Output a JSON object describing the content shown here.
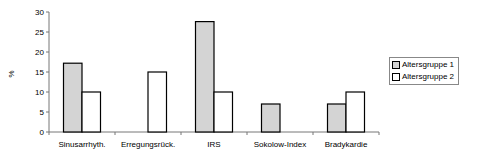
{
  "chart_data": {
    "type": "bar",
    "title": "",
    "xlabel": "",
    "ylabel": "%",
    "ylim": [
      0,
      30
    ],
    "yticks": [
      0,
      5,
      10,
      15,
      20,
      25,
      30
    ],
    "grid": false,
    "legend_position": "right",
    "categories": [
      "Sinusarrhyth.",
      "Erregungsrück.",
      "IRS",
      "Sokolow-Index",
      "Bradykardie"
    ],
    "series": [
      {
        "name": "Altersgruppe 1",
        "color": "#d4d4d4",
        "values": [
          17.2,
          0,
          27.6,
          7,
          7
        ]
      },
      {
        "name": "Altersgruppe 2",
        "color": "#ffffff",
        "values": [
          10,
          15,
          10,
          0,
          10
        ]
      }
    ]
  },
  "legend": {
    "items": [
      {
        "label": "Altersgruppe 1",
        "color": "#d4d4d4"
      },
      {
        "label": "Altersgruppe 2",
        "color": "#ffffff"
      }
    ]
  }
}
